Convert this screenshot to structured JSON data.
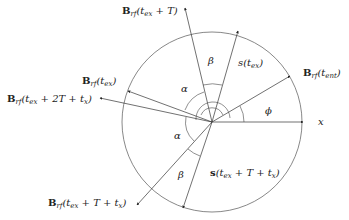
{
  "diagram": {
    "center": [
      212,
      122
    ],
    "radius": 90,
    "vectors": [
      {
        "id": "B_tex_T",
        "bold": "B",
        "sub": "rf",
        "arg": "(t",
        "argsub": "ex",
        "rest": " + T)",
        "end": [
          185,
          8
        ]
      },
      {
        "id": "s_tex",
        "bold": "",
        "sub": "",
        "arg": "s(t",
        "argsub": "ex",
        "rest": ")",
        "end": [
          238,
          31
        ]
      },
      {
        "id": "B_tent",
        "bold": "B",
        "sub": "rf",
        "arg": "(t",
        "argsub": "ent",
        "rest": ")",
        "end": [
          290,
          76
        ]
      },
      {
        "id": "x_axis",
        "label": "x",
        "end": [
          303,
          122
        ]
      },
      {
        "id": "B_tex",
        "bold": "B",
        "sub": "rf",
        "arg": "(t",
        "argsub": "ex",
        "rest": ")",
        "end": [
          128,
          91
        ]
      },
      {
        "id": "B_tex_2T",
        "bold": "B",
        "sub": "rf",
        "arg": "(t",
        "argsub": "ex",
        "rest": " + 2T + t",
        "restsub": "x",
        "rest2": ")",
        "end": [
          100,
          98
        ]
      },
      {
        "id": "B_tex_T_tx",
        "bold": "B",
        "sub": "rf",
        "arg": "(t",
        "argsub": "ex",
        "rest": " + T + t",
        "restsub": "x",
        "rest2": ")",
        "end": [
          137,
          205
        ]
      },
      {
        "id": "s_tex_T_tx",
        "bold": "s",
        "sub": "",
        "arg": "(t",
        "argsub": "ex",
        "rest": " + T + t",
        "restsub": "x",
        "rest2": ")",
        "end": [
          183,
          208
        ]
      }
    ],
    "labels": {
      "B_tex_T": "B_rf(t_ex + T)",
      "s_tex": "s(t_ex)",
      "B_tent": "B_rf(t_ent)",
      "x": "x",
      "B_tex": "B_rf(t_ex)",
      "B_tex_2T": "B_rf(t_ex + 2T + t_x)",
      "B_tex_T_tx": "B_rf(t_ex + T + t_x)",
      "s_tex_T_tx": "s(t_ex + T + t_x)"
    },
    "angles": {
      "alpha_top": "α",
      "alpha_bottom": "α",
      "beta_top": "β",
      "beta_bottom": "β",
      "phi": "ϕ"
    }
  }
}
